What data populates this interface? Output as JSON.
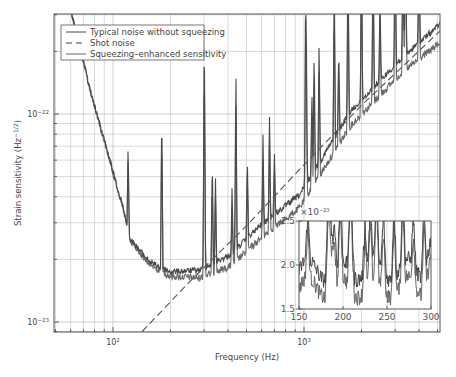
{
  "chart_data": {
    "type": "line",
    "title": "",
    "xlabel": "Frequency (Hz)",
    "ylabel": "Strain sensitivity (Hz^-1/2)",
    "xscale": "log",
    "yscale": "log",
    "xlim": [
      49,
      5100
    ],
    "ylim": [
      9e-24,
      3e-22
    ],
    "x_ticks": [
      {
        "value": 100,
        "label": "10²",
        "base": "10",
        "exp": "2"
      },
      {
        "value": 1000,
        "label": "10³",
        "base": "10",
        "exp": "3"
      }
    ],
    "y_ticks": [
      {
        "value": 1e-22,
        "label": "10⁻²²",
        "base": "10",
        "exp": "−22"
      },
      {
        "value": 1e-23,
        "label": "10⁻²³",
        "base": "10",
        "exp": "−23"
      }
    ],
    "grid": true,
    "legend_position": "upper left",
    "series": [
      {
        "name": "Typical noise without squeezing",
        "style": "solid",
        "color": "#4a4a4a",
        "points": [
          [
            55,
            4e-22
          ],
          [
            61,
            3e-22
          ],
          [
            76,
            1.3e-22
          ],
          [
            96,
            6e-23
          ],
          [
            112,
            3.65e-23
          ],
          [
            123,
            2.5e-23
          ],
          [
            156,
            1.94e-23
          ],
          [
            199,
            1.74e-23
          ],
          [
            285,
            1.78e-23
          ],
          [
            410,
            2.1e-23
          ],
          [
            588,
            2.9e-23
          ],
          [
            951,
            4.1e-23
          ],
          [
            1740,
            1.02e-22
          ],
          [
            3180,
            1.82e-22
          ],
          [
            5140,
            2.7e-22
          ]
        ]
      },
      {
        "name": "Shot noise",
        "style": "dashed",
        "color": "#555555",
        "points": [
          [
            142,
            9e-24
          ],
          [
            250,
            1.55e-23
          ],
          [
            500,
            2.9e-23
          ],
          [
            1000,
            5.7e-23
          ],
          [
            2000,
            1.1e-22
          ],
          [
            5140,
            2.5e-22
          ]
        ]
      },
      {
        "name": "Squeezing-enhanced sensitivity",
        "style": "solid",
        "color": "#6a6a6a",
        "points": [
          [
            55,
            4e-22
          ],
          [
            61,
            3e-22
          ],
          [
            76,
            1.3e-22
          ],
          [
            96,
            6e-23
          ],
          [
            112,
            3.6e-23
          ],
          [
            123,
            2.45e-23
          ],
          [
            156,
            1.88e-23
          ],
          [
            199,
            1.66e-23
          ],
          [
            285,
            1.63e-23
          ],
          [
            410,
            1.85e-23
          ],
          [
            588,
            2.5e-23
          ],
          [
            951,
            3.55e-23
          ],
          [
            1740,
            8.7e-23
          ],
          [
            3180,
            1.55e-22
          ],
          [
            5140,
            2.2e-22
          ]
        ]
      }
    ],
    "spikes_hz": [
      60,
      120,
      180,
      300,
      302,
      331,
      344,
      420,
      440,
      505,
      610,
      660,
      700,
      1020,
      1030,
      1100,
      1130,
      1200,
      1440,
      1520,
      1700,
      2000,
      2300,
      2500,
      3000,
      3300,
      3400,
      4000
    ],
    "inset": {
      "multiplier_label": "×10⁻²³",
      "multiplier_base": "×10",
      "multiplier_exp": "−23",
      "xlim": [
        150,
        300
      ],
      "ylim": [
        1.5,
        2.5
      ],
      "x_ticks": [
        "150",
        "200",
        "250",
        "300"
      ],
      "y_ticks": [
        "2.5",
        "2.0",
        "1.5"
      ],
      "typical_level": 1.95,
      "squeezed_level": 1.75
    }
  },
  "legend": {
    "items": [
      {
        "label": "Typical noise without squeezing",
        "style": "solid"
      },
      {
        "label": "Shot noise",
        "style": "dashed"
      },
      {
        "label": "Squeezing–enhanced sensitivity",
        "style": "solid"
      }
    ]
  },
  "axes": {
    "x_title": "Frequency (Hz)",
    "y_title": "Strain sensitivity (Hz",
    "y_title_exp": "−1/2",
    "y_title_close": ")"
  }
}
